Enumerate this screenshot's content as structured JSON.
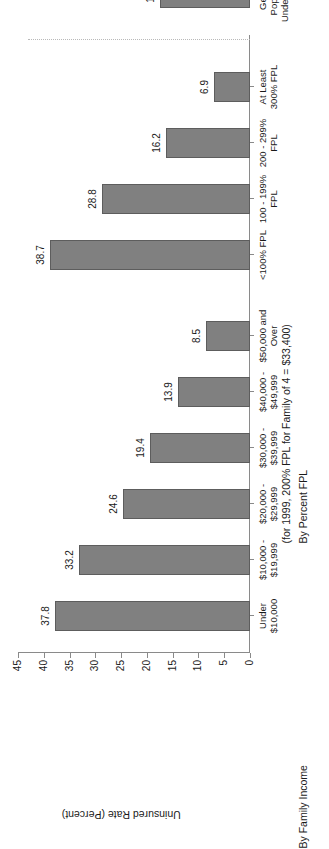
{
  "chart_data": {
    "type": "bar",
    "title": "",
    "xlabel": "",
    "ylabel": "Uninsured Rate (Percent)",
    "ylim": [
      0,
      45
    ],
    "ytick_labels": [
      "0",
      "5",
      "10",
      "15",
      "20",
      "25",
      "30",
      "35",
      "40",
      "45"
    ],
    "ytick_values": [
      0,
      5,
      10,
      15,
      20,
      25,
      30,
      35,
      40,
      45
    ],
    "grid": false,
    "legend": "none",
    "orientation": "vertical-bars-on-rotated-page",
    "bar_color": "#808080",
    "bar_edge_color": "#5d5d5d",
    "axis_color": "#8a8a8a",
    "separator_color": "#b9b9b9",
    "categories": [
      "Under $10,000",
      "$10,000 - $19,999",
      "$20,000 - $29,999",
      "$30,000 - $39,999",
      "$40,000 - $49,999",
      "$50,000 and Over",
      "<100% FPL",
      "100 - 199% FPL",
      "200 - 299% FPL",
      "At Least 300% FPL",
      "General Population Under Age 65"
    ],
    "values": [
      37.8,
      33.2,
      24.6,
      19.4,
      13.9,
      8.5,
      38.7,
      28.8,
      16.2,
      6.9,
      17.5
    ],
    "annotations": [
      "By Family Income",
      "By Percent FPL",
      "(for 1999, 200% FPL for Family of 4 = $33,400)"
    ]
  },
  "axis": {
    "value_axis_title": "Uninsured Rate (Percent)",
    "ticks": [
      {
        "label": "0",
        "value": 0
      },
      {
        "label": "5",
        "value": 5
      },
      {
        "label": "10",
        "value": 10
      },
      {
        "label": "15",
        "value": 15
      },
      {
        "label": "20",
        "value": 20
      },
      {
        "label": "25",
        "value": 25
      },
      {
        "label": "30",
        "value": 30
      },
      {
        "label": "35",
        "value": 35
      },
      {
        "label": "40",
        "value": 40
      },
      {
        "label": "45",
        "value": 45
      }
    ]
  },
  "bars": [
    {
      "value": 37.8,
      "value_label": "37.8",
      "label_line1": "Under",
      "label_line2": "$10,000",
      "label_line3": ""
    },
    {
      "value": 33.2,
      "value_label": "33.2",
      "label_line1": "$10,000 -",
      "label_line2": "$19,999",
      "label_line3": ""
    },
    {
      "value": 24.6,
      "value_label": "24.6",
      "label_line1": "$20,000 -",
      "label_line2": "$29,999",
      "label_line3": ""
    },
    {
      "value": 19.4,
      "value_label": "19.4",
      "label_line1": "$30,000 -",
      "label_line2": "$39,999",
      "label_line3": ""
    },
    {
      "value": 13.9,
      "value_label": "13.9",
      "label_line1": "$40,000 -",
      "label_line2": "$49,999",
      "label_line3": ""
    },
    {
      "value": 8.5,
      "value_label": "8.5",
      "label_line1": "$50,000 and",
      "label_line2": "Over",
      "label_line3": ""
    },
    {
      "value": 38.7,
      "value_label": "38.7",
      "label_line1": "<100% FPL",
      "label_line2": "",
      "label_line3": ""
    },
    {
      "value": 28.8,
      "value_label": "28.8",
      "label_line1": "100 - 199%",
      "label_line2": "FPL",
      "label_line3": ""
    },
    {
      "value": 16.2,
      "value_label": "16.2",
      "label_line1": "200 - 299%",
      "label_line2": "FPL",
      "label_line3": ""
    },
    {
      "value": 6.9,
      "value_label": "6.9",
      "label_line1": "At Least",
      "label_line2": "300% FPL",
      "label_line3": ""
    },
    {
      "value": 17.5,
      "value_label": "17.5",
      "label_line1": "General",
      "label_line2": "Population",
      "label_line3": "Under Age 65"
    }
  ],
  "groups": {
    "income_caption": "By Family Income",
    "fpl_caption": "By Percent FPL",
    "fpl_note": "(for 1999, 200% FPL for Family of 4 = $33,400)"
  }
}
